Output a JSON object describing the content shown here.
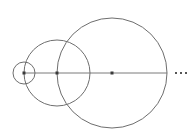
{
  "diagram": {
    "stroke_color": "#6e6e6e",
    "point_color": "#3a3a3a",
    "axis": {
      "x1": 24,
      "x2": 167,
      "y": 73
    },
    "circles": [
      {
        "cx": 24,
        "cy": 73,
        "r": 11
      },
      {
        "cx": 57,
        "cy": 73,
        "r": 33
      },
      {
        "cx": 112,
        "cy": 73,
        "r": 55
      }
    ],
    "center_points": [
      {
        "cx": 24,
        "cy": 73
      },
      {
        "cx": 57,
        "cy": 73
      },
      {
        "cx": 112,
        "cy": 73
      }
    ],
    "ellipsis": {
      "label": "···",
      "dots": [
        {
          "cx": 176,
          "cy": 73
        },
        {
          "cx": 181,
          "cy": 73
        },
        {
          "cx": 186,
          "cy": 73
        }
      ]
    }
  }
}
